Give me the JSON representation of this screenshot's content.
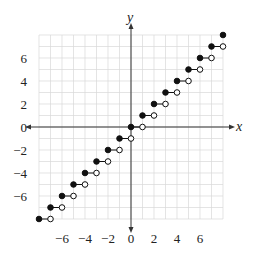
{
  "chart_data": {
    "type": "scatter",
    "title": "",
    "subtitle": "",
    "xlabel": "x",
    "ylabel": "y",
    "xlim": [
      -8,
      8
    ],
    "ylim": [
      -8,
      8
    ],
    "grid": true,
    "grid_minor_step": 1,
    "x_ticks": [
      -6,
      -4,
      -2,
      0,
      2,
      4,
      6
    ],
    "y_ticks": [
      -6,
      -4,
      -2,
      0,
      2,
      4,
      6
    ],
    "x_tick_labels": [
      "−6",
      "−4",
      "−2",
      "0",
      "2",
      "4",
      "6"
    ],
    "y_tick_labels": [
      "−6",
      "−4",
      "−2",
      "0",
      "2",
      "4",
      "6"
    ],
    "legend": null,
    "series": [
      {
        "name": "closed endpoints",
        "marker": "filled-circle",
        "points": [
          [
            -8,
            -8
          ],
          [
            -7,
            -7
          ],
          [
            -6,
            -6
          ],
          [
            -5,
            -5
          ],
          [
            -4,
            -4
          ],
          [
            -3,
            -3
          ],
          [
            -2,
            -2
          ],
          [
            -1,
            -1
          ],
          [
            0,
            0
          ],
          [
            1,
            1
          ],
          [
            2,
            2
          ],
          [
            3,
            3
          ],
          [
            4,
            4
          ],
          [
            5,
            5
          ],
          [
            6,
            6
          ],
          [
            7,
            7
          ],
          [
            8,
            8
          ]
        ]
      },
      {
        "name": "open endpoints",
        "marker": "open-circle",
        "points": [
          [
            -7,
            -8
          ],
          [
            -6,
            -7
          ],
          [
            -5,
            -6
          ],
          [
            -4,
            -5
          ],
          [
            -3,
            -4
          ],
          [
            -2,
            -3
          ],
          [
            -1,
            -2
          ],
          [
            0,
            -1
          ],
          [
            1,
            0
          ],
          [
            2,
            1
          ],
          [
            3,
            2
          ],
          [
            4,
            3
          ],
          [
            5,
            4
          ],
          [
            6,
            5
          ],
          [
            7,
            6
          ],
          [
            8,
            7
          ]
        ]
      }
    ],
    "segments": [
      [
        [
          -8,
          -8
        ],
        [
          -7,
          -8
        ]
      ],
      [
        [
          -7,
          -7
        ],
        [
          -6,
          -7
        ]
      ],
      [
        [
          -6,
          -6
        ],
        [
          -5,
          -6
        ]
      ],
      [
        [
          -5,
          -5
        ],
        [
          -4,
          -5
        ]
      ],
      [
        [
          -4,
          -4
        ],
        [
          -3,
          -4
        ]
      ],
      [
        [
          -3,
          -3
        ],
        [
          -2,
          -3
        ]
      ],
      [
        [
          -2,
          -2
        ],
        [
          -1,
          -2
        ]
      ],
      [
        [
          -1,
          -1
        ],
        [
          0,
          -1
        ]
      ],
      [
        [
          0,
          0
        ],
        [
          1,
          0
        ]
      ],
      [
        [
          1,
          1
        ],
        [
          2,
          1
        ]
      ],
      [
        [
          2,
          2
        ],
        [
          3,
          2
        ]
      ],
      [
        [
          3,
          3
        ],
        [
          4,
          3
        ]
      ],
      [
        [
          4,
          4
        ],
        [
          5,
          4
        ]
      ],
      [
        [
          5,
          5
        ],
        [
          6,
          5
        ]
      ],
      [
        [
          6,
          6
        ],
        [
          7,
          6
        ]
      ],
      [
        [
          7,
          7
        ],
        [
          8,
          7
        ]
      ]
    ]
  },
  "style": {
    "grid_color": "#d9d9d9",
    "axis_color": "#333333",
    "point_color": "#111111"
  }
}
